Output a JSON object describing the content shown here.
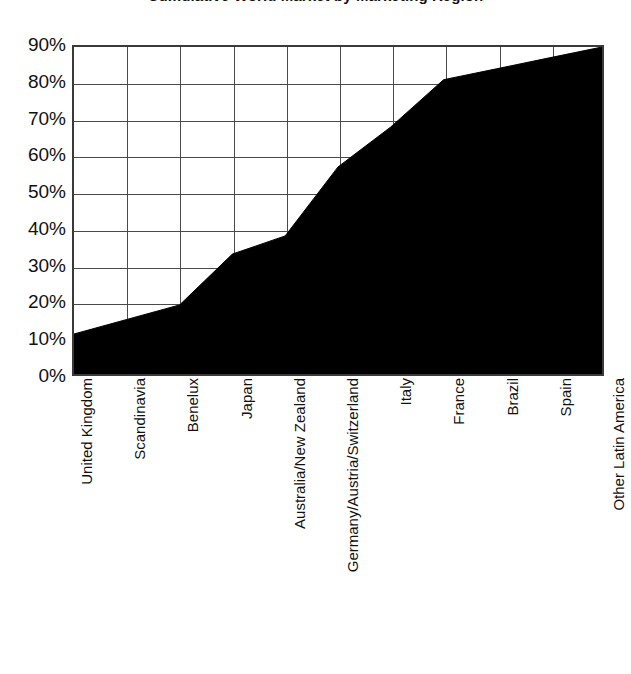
{
  "chart_data": {
    "type": "area",
    "title": "Cumulative World Market by Marketing Region",
    "xlabel": "",
    "ylabel": "",
    "ylim": [
      0,
      90
    ],
    "yticks": [
      "0%",
      "10%",
      "20%",
      "30%",
      "40%",
      "50%",
      "60%",
      "70%",
      "80%",
      "90%"
    ],
    "ytick_values": [
      0,
      10,
      20,
      30,
      40,
      50,
      60,
      70,
      80,
      90
    ],
    "grid": true,
    "legend": "none",
    "categories": [
      "United Kingdom",
      "Scandinavia",
      "Benelux",
      "Japan",
      "Australia/New Zealand",
      "Germany/Austria/Switzerland",
      "Italy",
      "France",
      "Brazil",
      "Spain",
      "Other Latin America"
    ],
    "values": [
      11,
      15,
      19,
      33,
      38,
      57,
      68,
      81,
      84,
      87,
      90
    ],
    "series": [
      {
        "name": "Cumulative share of world market",
        "values": [
          11,
          15,
          19,
          33,
          38,
          57,
          68,
          81,
          84,
          87,
          90
        ]
      }
    ],
    "fill_color": "#000000",
    "axis_color": "#3a3a3a",
    "background_color": "#ffffff"
  }
}
